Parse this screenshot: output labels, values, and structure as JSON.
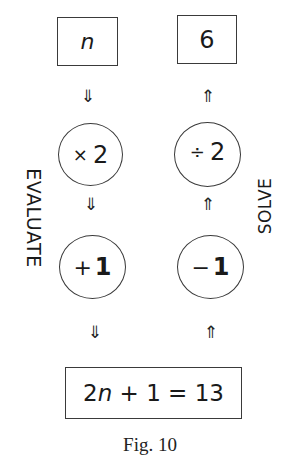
{
  "diagram": {
    "left_column": {
      "start_box": "n",
      "step1": {
        "op": "×",
        "value": "2"
      },
      "step2": {
        "op": "+",
        "value": "1"
      },
      "arrow": "⇓",
      "label": "EVALUATE"
    },
    "right_column": {
      "result_box": "6",
      "step1": {
        "op": "÷",
        "value": "2"
      },
      "step2": {
        "op": "−",
        "value": "1"
      },
      "arrow": "⇑",
      "label": "SOLVE"
    },
    "equation": {
      "coef": "2",
      "var": "n",
      "rest": " + 1 = 13"
    },
    "caption": "Fig. 10"
  }
}
